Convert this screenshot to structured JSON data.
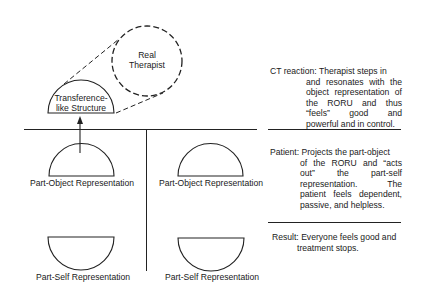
{
  "diagram": {
    "top": {
      "real_therapist": {
        "line1": "Real",
        "line2": "Therapist"
      },
      "transference": {
        "line1": "Transference-",
        "line2": "like Structure"
      }
    },
    "left_column": {
      "object_label": "Part-Object Representation",
      "self_label": "Part-Self Representation"
    },
    "right_column": {
      "object_label": "Part-Object Representation",
      "self_label": "Part-Self Representation"
    },
    "notes": [
      {
        "lead": "CT reaction: Therapist steps in",
        "rest": "and resonates with the object representation of the RORU and thus “feels” good and powerful and in control."
      },
      {
        "lead": "Patient: Projects the part-object",
        "rest": "of the RORU and “acts out” the part-self representation. The patient feels dependent, passive, and helpless."
      },
      {
        "lead": "Result: Everyone feels good and",
        "rest": "treatment stops."
      }
    ]
  }
}
